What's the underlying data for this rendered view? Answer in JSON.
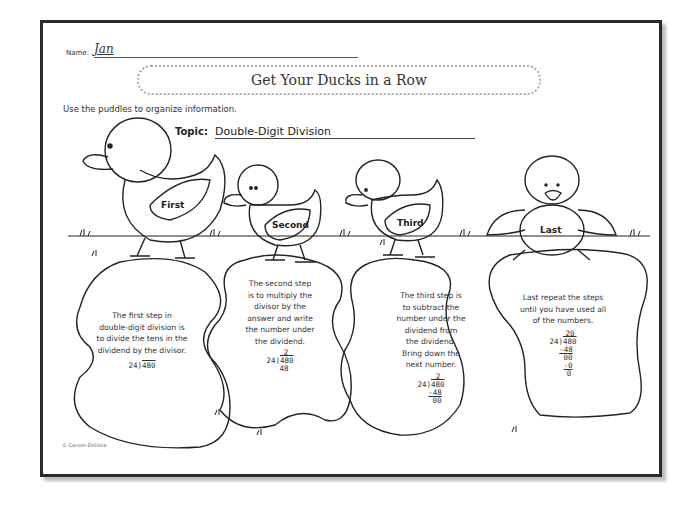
{
  "worksheet": {
    "name_label": "Name:",
    "name_value": "Jan",
    "title": "Get Your Ducks in a Row",
    "instructions": "Use the puddles to organize information.",
    "topic_label": "Topic:",
    "topic_value": "Double-Digit Division",
    "copyright": "© Carson-Dellosa"
  },
  "ducks": [
    {
      "label": "First"
    },
    {
      "label": "Second"
    },
    {
      "label": "Third"
    },
    {
      "label": "Last"
    }
  ],
  "puddles": [
    {
      "text": [
        "The first step in",
        "double-digit division is",
        "to divide the tens in the",
        "dividend by the divisor."
      ],
      "math": {
        "divisor": "24",
        "dividend": "480"
      }
    },
    {
      "text": [
        "The second step",
        "is to multiply the",
        "divisor by the",
        "answer and write",
        "the number under",
        "the dividend."
      ],
      "math": {
        "quotient": "2",
        "divisor": "24",
        "dividend": "480",
        "product": "48"
      }
    },
    {
      "text": [
        "The third step is",
        "to subtract the",
        "number under the",
        "dividend from",
        "the dividend.",
        "Bring down the",
        "next number."
      ],
      "math": {
        "quotient": "2",
        "divisor": "24",
        "dividend": "480",
        "subtract": "-48",
        "remainder": "00"
      }
    },
    {
      "text": [
        "Last repeat the steps",
        "until you have used all",
        "of the numbers."
      ],
      "math": {
        "quotient": "20",
        "divisor": "24",
        "dividend": "480",
        "subtract": "-48",
        "remainder": "00",
        "subtract2": "-0",
        "final": "0"
      }
    }
  ]
}
